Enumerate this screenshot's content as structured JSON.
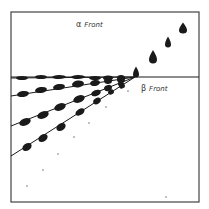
{
  "labels": {
    "alpha_front": {
      "greek": "α",
      "text": "Front"
    },
    "beta_front": {
      "greek": "β",
      "text": "Front"
    }
  },
  "colors": {
    "ink": "#1a1a1a",
    "frame": "#444444",
    "background": "#ffffff"
  },
  "frame": {
    "x": 11,
    "y": 12,
    "w": 188,
    "h": 190
  },
  "front_line_y": 77,
  "convergence_point": {
    "x": 135,
    "y": 77
  },
  "rays": [
    {
      "start": {
        "x": 11,
        "y": 78
      },
      "blobs": [
        [
          22,
          78,
          6,
          2
        ],
        [
          41,
          77,
          6,
          2
        ],
        [
          59,
          77,
          7,
          2
        ],
        [
          78,
          77,
          7,
          2
        ],
        [
          95,
          78,
          6,
          2
        ],
        [
          108,
          78,
          5,
          2.5
        ],
        [
          121,
          78,
          4,
          3
        ]
      ]
    },
    {
      "start": {
        "x": 11,
        "y": 96
      },
      "blobs": [
        [
          23,
          94,
          6,
          3
        ],
        [
          41,
          90,
          6,
          3
        ],
        [
          59,
          87,
          6,
          3
        ],
        [
          78,
          84,
          6,
          3.5
        ],
        [
          95,
          83,
          5,
          3
        ],
        [
          108,
          81,
          4,
          3
        ],
        [
          121,
          80,
          4,
          3
        ]
      ]
    },
    {
      "start": {
        "x": 11,
        "y": 126
      },
      "blobs": [
        [
          25,
          122,
          6,
          3.5
        ],
        [
          43,
          115,
          6,
          3.5
        ],
        [
          60,
          107,
          6,
          3.5
        ],
        [
          79,
          99,
          6,
          3.5
        ],
        [
          96,
          93,
          5,
          3
        ],
        [
          108,
          88,
          4,
          3
        ],
        [
          121,
          84,
          3,
          3
        ]
      ]
    },
    {
      "start": {
        "x": 11,
        "y": 156
      },
      "blobs": [
        [
          27,
          147,
          5,
          3.5
        ],
        [
          43,
          138,
          5,
          3.5
        ],
        [
          61,
          127,
          5,
          3.5
        ],
        [
          80,
          112,
          5,
          3
        ],
        [
          97,
          101,
          4,
          3
        ],
        [
          111,
          92,
          3,
          2.5
        ],
        [
          122,
          86,
          3,
          2.5
        ]
      ]
    }
  ],
  "alpha_drops": [
    [
      136,
      73,
      3,
      4
    ],
    [
      153,
      58,
      4,
      5
    ],
    [
      168,
      43,
      3,
      4
    ],
    [
      183,
      29,
      4,
      4
    ]
  ],
  "scatter_dots": [
    [
      106,
      107
    ],
    [
      89,
      123
    ],
    [
      74,
      137
    ],
    [
      58,
      154
    ],
    [
      43,
      170
    ],
    [
      27,
      186
    ],
    [
      166,
      197
    ],
    [
      128,
      91
    ]
  ]
}
